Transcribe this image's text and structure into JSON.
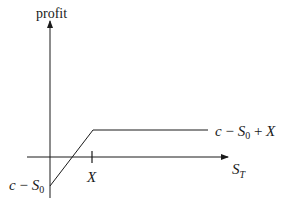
{
  "diagram": {
    "type": "payoff-diagram",
    "y_axis_label": "profit",
    "x_axis_label": {
      "base": "S",
      "sub": "T"
    },
    "strike_label": "X",
    "intercept_label": {
      "c": "c",
      "minus": " − ",
      "S": "S",
      "sub": "0"
    },
    "cap_label": {
      "c": "c",
      "minus": " − ",
      "S": "S",
      "sub": "0",
      "plus": " + ",
      "X": "X"
    },
    "colors": {
      "line": "#1a1a1a",
      "background": "#ffffff"
    }
  }
}
